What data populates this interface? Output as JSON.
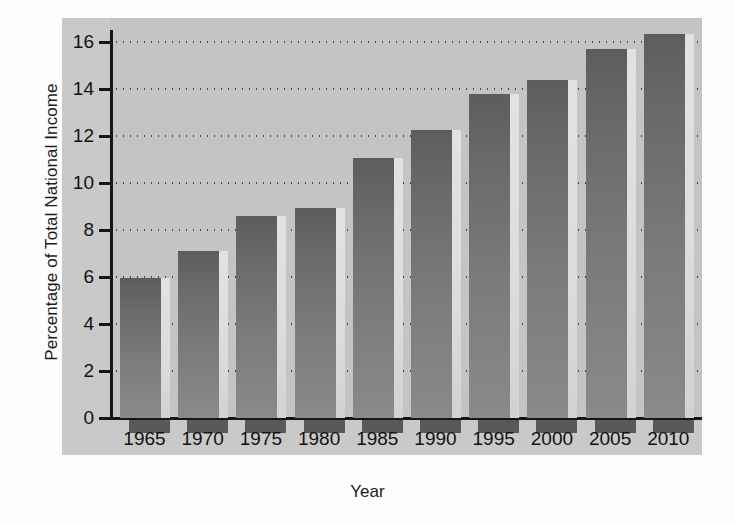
{
  "chart_data": {
    "type": "bar",
    "title": "",
    "xlabel": "Year",
    "ylabel": "Percentage of Total National Income",
    "categories": [
      "1965",
      "1970",
      "1975",
      "1980",
      "1985",
      "1990",
      "1995",
      "2000",
      "2005",
      "2010"
    ],
    "values": [
      5.95,
      7.1,
      8.6,
      8.95,
      11.05,
      12.25,
      13.8,
      14.4,
      15.7,
      16.35
    ],
    "ylim": [
      0,
      17
    ],
    "yticks": [
      0,
      2,
      4,
      6,
      8,
      10,
      12,
      14,
      16
    ],
    "ytick_labels": [
      "0",
      "2",
      "4",
      "6",
      "8",
      "10",
      "12",
      "14",
      "16"
    ],
    "grid": "horizontal-dotted",
    "legend": "none",
    "series": [
      {
        "name": "Percentage of Total National Income",
        "values": [
          5.95,
          7.1,
          8.6,
          8.95,
          11.05,
          12.25,
          13.8,
          14.4,
          15.7,
          16.35
        ]
      }
    ]
  },
  "axes": {
    "y_title": "Percentage of Total National Income",
    "x_title": "Year"
  },
  "colors": {
    "panel_background": "#c9c9c9",
    "plot_background": "#c4c4c4",
    "bar_fill": "#6f6f6f",
    "bar_highlight": "#dedede",
    "axis": "#161616",
    "grid_dot": "#3a3a3a",
    "text": "#121212"
  }
}
